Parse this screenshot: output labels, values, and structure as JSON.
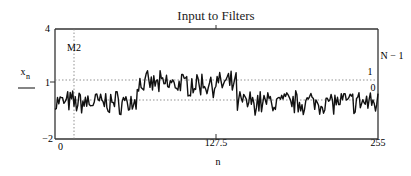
{
  "chart_data": {
    "type": "line",
    "title": "Input to Filters",
    "xlabel": "n",
    "ylabel": "x_n",
    "ylabel_main": "x",
    "ylabel_sub": "n",
    "xlim": [
      0,
      255
    ],
    "ylim": [
      -2,
      4
    ],
    "x_ticks": [
      "0",
      "127.5",
      "255"
    ],
    "y_ticks": [
      "4",
      "1",
      "-2"
    ],
    "y_tick_labels": {
      "top": "4",
      "mid": "1",
      "bottom": "−2"
    },
    "grid": false,
    "legend": "none",
    "markers": {
      "vertical": {
        "label": "M2",
        "x": 10
      },
      "horizontal": [
        {
          "label": "1",
          "y": 1
        },
        {
          "label": "0",
          "y": 0
        }
      ],
      "right_label": "N − 1"
    },
    "series": [
      {
        "name": "x_n",
        "description": "Noisy step signal: baseline ~0 for n in [0,~64], elevated ~1 for n in [~64,~143], returns ~0 for n in [~143,255]; noise amplitude ~±0.5",
        "segments": [
          {
            "n_start": 0,
            "n_end": 64,
            "mean": 0.0
          },
          {
            "n_start": 64,
            "n_end": 143,
            "mean": 1.0
          },
          {
            "n_start": 143,
            "n_end": 255,
            "mean": 0.0
          }
        ]
      }
    ]
  }
}
